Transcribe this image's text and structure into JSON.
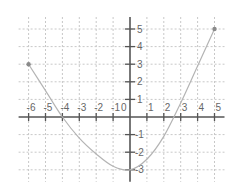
{
  "chart_data": {
    "type": "line",
    "title": "",
    "xlabel": "",
    "ylabel": "",
    "xlim": [
      -6,
      5
    ],
    "ylim": [
      -3,
      5
    ],
    "grid": true,
    "x_ticks": [
      -6,
      -5,
      -4,
      -3,
      -2,
      -1,
      1,
      2,
      3,
      4,
      5
    ],
    "y_ticks": [
      -3,
      -2,
      -1,
      1,
      2,
      3,
      4,
      5
    ],
    "origin_label": "0",
    "series": [
      {
        "name": "curve",
        "x": [
          -6,
          -5,
          -4,
          -3,
          -2,
          -1,
          0,
          1,
          2,
          3,
          4,
          5
        ],
        "y": [
          3,
          1.5,
          0,
          -1.2,
          -2.1,
          -2.8,
          -3,
          -2.4,
          -1.1,
          0.8,
          2.9,
          5
        ],
        "endpoints": [
          [
            -6,
            3
          ],
          [
            5,
            5
          ]
        ],
        "color": "#b4b4b4"
      }
    ]
  }
}
